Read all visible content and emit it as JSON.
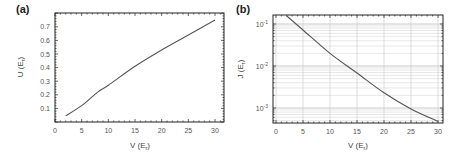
{
  "chart_data": [
    {
      "panel": "(a)",
      "type": "line",
      "title": "",
      "xlabel": "V (E_r)",
      "ylabel": "U (E_r)",
      "xlim": [
        0,
        31.7
      ],
      "ylim": [
        0,
        0.8
      ],
      "yscale": "linear",
      "grid": false,
      "x_ticks": [
        0,
        5,
        10,
        15,
        20,
        25,
        30
      ],
      "x_tick_labels": [
        "0",
        "5",
        "10",
        "15",
        "20",
        "25",
        "30"
      ],
      "y_ticks": [
        0.1,
        0.2,
        0.3,
        0.4,
        0.5,
        0.6,
        0.7
      ],
      "y_tick_labels": [
        "0.1",
        "0.2",
        "0.3",
        "0.4",
        "0.5",
        "0.6",
        "0.7"
      ],
      "series": [
        {
          "name": "U(V)",
          "color": "#555555",
          "x": [
            2,
            5,
            8,
            10,
            15,
            20,
            25,
            30
          ],
          "y": [
            0.045,
            0.12,
            0.22,
            0.27,
            0.41,
            0.53,
            0.64,
            0.75
          ]
        }
      ]
    },
    {
      "panel": "(b)",
      "type": "line",
      "title": "",
      "xlabel": "V (E_r)",
      "ylabel": "J (E_r)",
      "xlim": [
        -0.6,
        31
      ],
      "ylim": [
        0.00047,
        0.16
      ],
      "yscale": "log",
      "grid": true,
      "x_ticks": [
        0,
        5,
        10,
        15,
        20,
        25,
        30
      ],
      "x_tick_labels": [
        "0",
        "5",
        "10",
        "15",
        "20",
        "25",
        "30"
      ],
      "y_ticks": [
        0.1,
        0.01,
        0.001
      ],
      "y_tick_labels": [
        {
          "base": "10",
          "exp": "-1"
        },
        {
          "base": "10",
          "exp": "-2"
        },
        {
          "base": "10",
          "exp": "-3"
        }
      ],
      "series": [
        {
          "name": "J(V)",
          "color": "#555555",
          "x": [
            2,
            5,
            10,
            15,
            20,
            25,
            30
          ],
          "y": [
            0.155,
            0.072,
            0.02,
            0.0068,
            0.0023,
            0.00095,
            0.00048
          ]
        }
      ]
    }
  ],
  "labels": {
    "panel_a": "(a)",
    "panel_b": "(b)",
    "a_xlabel_main": "V (E",
    "a_xlabel_sub": "r",
    "a_xlabel_end": ")",
    "a_ylabel_main": "U (E",
    "a_ylabel_sub": "r",
    "a_ylabel_end": ")",
    "b_xlabel_main": "V (E",
    "b_xlabel_sub": "r",
    "b_xlabel_end": ")",
    "b_ylabel_main": "J (E",
    "b_ylabel_sub": "r",
    "b_ylabel_end": ")"
  }
}
